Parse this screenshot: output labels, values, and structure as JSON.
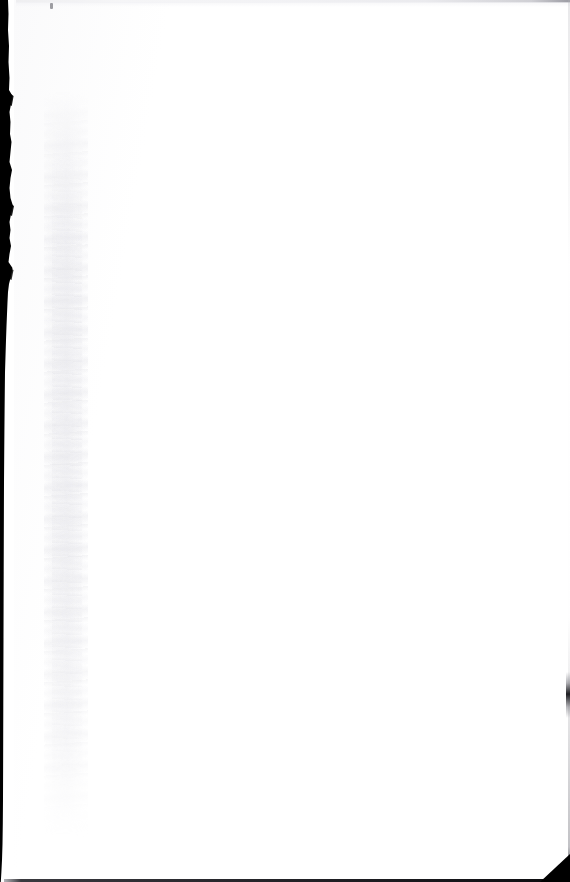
{
  "page": {
    "kind": "scanned-document-page",
    "content_state": "blank",
    "body_text": "",
    "width_px": 570,
    "height_px": 882
  },
  "artifacts": {
    "gutter_shadow": {
      "name": "left-binding-shadow",
      "description": "Dark ragged binding/gutter band along the left edge",
      "color": "#000000",
      "width_px_top": 13,
      "width_px_bottom": 3
    },
    "bleed_band": {
      "name": "bleed-through-band",
      "description": "Faint mottled grey vertical band near the gutter",
      "color": "#ececef"
    },
    "top_edge": {
      "name": "top-paper-edge",
      "description": "Faint grey scan line along the top edge",
      "color": "#eeeef0"
    },
    "bottom_edge": {
      "name": "bottom-paper-edge",
      "description": "Thin dark scan line along the bottom edge",
      "color": "#1a1a1e"
    },
    "right_sliver": {
      "name": "right-edge-sliver",
      "description": "Short dark sliver on the right edge",
      "color": "#14141a"
    },
    "corner_wedge": {
      "name": "bottom-right-corner-wedge",
      "description": "Dark triangular wedge at the bottom-right corner",
      "color": "#000000"
    },
    "speck": {
      "name": "dust-speck",
      "description": "Tiny dark speck near the top of the page",
      "color": "#787880"
    }
  },
  "colors": {
    "paper": "#ffffff",
    "shadow": "#000000",
    "faint_grey": "#ececef"
  }
}
